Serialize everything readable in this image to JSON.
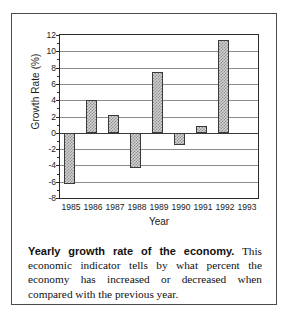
{
  "chart_data": {
    "type": "bar",
    "title": "",
    "xlabel": "Year",
    "ylabel": "Growth Rate (%)",
    "categories": [
      "1985",
      "1986",
      "1987",
      "1988",
      "1989",
      "1990",
      "1991",
      "1992",
      "1993"
    ],
    "values": [
      -6.3,
      4.0,
      2.2,
      -4.3,
      7.5,
      -1.5,
      0.8,
      11.4,
      null
    ],
    "ylim": [
      -8,
      12
    ],
    "ytick_labels": [
      "12",
      "10",
      "8",
      "6",
      "4",
      "2",
      "0",
      "-2",
      "-4",
      "-6",
      "-8"
    ],
    "ytick_values": [
      12,
      10,
      8,
      6,
      4,
      2,
      0,
      -2,
      -4,
      -6,
      -8
    ],
    "grid": true,
    "legend": "none",
    "bar_fill": "#d2d2d2",
    "bar_hatch": "#8f8f8f",
    "bar_border": "#3a3a3a",
    "gridline_color": "#8c8c8c",
    "axis_color": "#2b2b2b"
  },
  "caption": {
    "lead": "Yearly growth rate of the economy.",
    "body": " This economic indicator tells by what percent the economy has increased or decreased when compared with the previous year."
  }
}
